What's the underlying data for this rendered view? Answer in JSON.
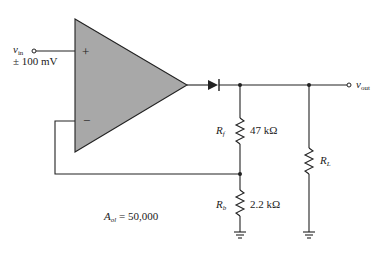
{
  "diagram": {
    "type": "circuit-schematic",
    "components": {
      "opamp": {
        "plus_label": "+",
        "minus_label": "−",
        "fill_color": "#a8a8a8"
      },
      "input": {
        "name_main": "v",
        "name_sub": "in",
        "amplitude": "± 100 mV"
      },
      "output": {
        "name_main": "v",
        "name_sub": "out"
      },
      "diode": {
        "name": "D"
      },
      "rf": {
        "name_main": "R",
        "name_sub": "f",
        "value": "47 kΩ"
      },
      "rb": {
        "name_main": "R",
        "name_sub": "b",
        "value": "2.2 kΩ"
      },
      "rl": {
        "name_main": "R",
        "name_sub": "L"
      }
    },
    "gain_label": {
      "main": "A",
      "sub": "ol",
      "value": " = 50,000"
    }
  }
}
